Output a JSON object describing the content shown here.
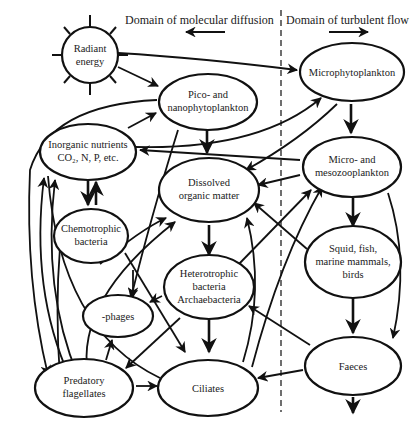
{
  "header": {
    "left_domain": "Domain of molecular diffusion",
    "right_domain": "Domain of turbulent flow"
  },
  "nodes": {
    "radiant": [
      "Radiant",
      "energy"
    ],
    "pico": [
      "Pico- and",
      "nanophytoplankton"
    ],
    "micro_phyto": [
      "Microphytoplankton"
    ],
    "inorganic": [
      "Inorganic nutrients",
      "CO₂, N, P, etc."
    ],
    "micro_zoo": [
      "Micro- and",
      "mesozooplankton"
    ],
    "dom": [
      "Dissolved",
      "organic matter"
    ],
    "chemo": [
      "Chemotrophic",
      "bacteria"
    ],
    "squid": [
      "Squid, fish,",
      "marine mammals,",
      "birds"
    ],
    "hetero": [
      "Heterotrophic",
      "bacteria",
      "Archaebacteria"
    ],
    "phages": [
      "-phages"
    ],
    "faeces": [
      "Faeces"
    ],
    "predatory": [
      "Predatory",
      "flagellates"
    ],
    "ciliates": [
      "Ciliates"
    ]
  },
  "colors": {
    "line": "#111111",
    "background": "#ffffff"
  }
}
